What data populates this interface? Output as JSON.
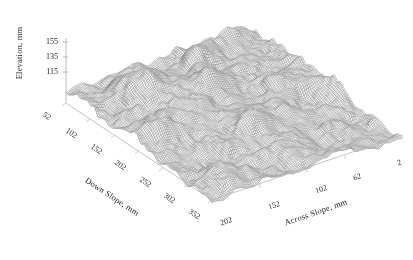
{
  "figure": {
    "kind": "3d-surface-plot",
    "background_color": "#ffffff",
    "line_color": "#555555",
    "axis_color": "#aaaaaa",
    "text_color": "#1f1f1f"
  },
  "chart_data": {
    "type": "surface",
    "title": "",
    "subtitle": "",
    "grid": false,
    "legend": null,
    "projection": "isometric-3d",
    "xlabel": "Across Slope, mm",
    "ylabel": "Down Slope, mm",
    "zlabel": "Elevation, mm",
    "x_ticks": [
      202,
      152,
      102,
      62,
      2
    ],
    "x_tick_labels": [
      "202",
      "152",
      "102",
      "62",
      "2"
    ],
    "y_ticks": [
      52,
      102,
      152,
      202,
      252,
      302,
      352
    ],
    "y_tick_labels": [
      "52",
      "102",
      "152",
      "202",
      "252",
      "302",
      "352"
    ],
    "z_ticks": [
      155,
      135,
      115
    ],
    "z_tick_labels": [
      "155",
      "135",
      "115"
    ],
    "xlim": [
      2,
      202
    ],
    "ylim": [
      52,
      352
    ],
    "zlim": [
      115,
      160
    ],
    "units": "mm",
    "features": [
      {
        "name": "mound-upper-left",
        "across_slope": 150,
        "down_slope": 110,
        "peak_elevation": 158
      },
      {
        "name": "mound-upper-right",
        "across_slope": 95,
        "down_slope": 135,
        "peak_elevation": 156
      },
      {
        "name": "mound-mid-left",
        "across_slope": 175,
        "down_slope": 205,
        "peak_elevation": 146
      },
      {
        "name": "mound-mid-center",
        "across_slope": 100,
        "down_slope": 245,
        "peak_elevation": 144
      }
    ],
    "surface_mean_elevation": 130,
    "surface_roughness_rms": 6
  },
  "axes": {
    "elevation": {
      "label": "Elevation, mm",
      "ticks": [
        "155",
        "135",
        "115"
      ]
    },
    "down_slope": {
      "label": "Down Slope, mm",
      "ticks": [
        "52",
        "102",
        "152",
        "202",
        "252",
        "302",
        "352"
      ]
    },
    "across_slope": {
      "label": "Across Slope, mm",
      "ticks": [
        "202",
        "152",
        "102",
        "62",
        "2"
      ]
    }
  }
}
